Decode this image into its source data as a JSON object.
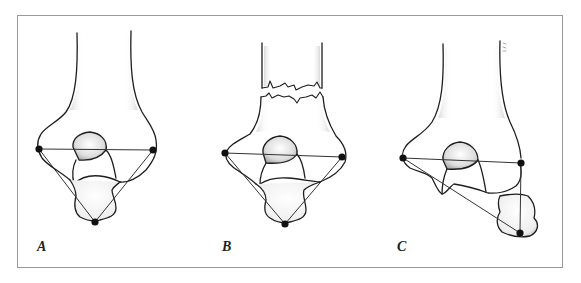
{
  "figure": {
    "panels": [
      {
        "id": "A",
        "label": "A",
        "description": "Normal distal humerus: epicondyles and olecranon tip form an isosceles triangle"
      },
      {
        "id": "B",
        "label": "B",
        "description": "Supracondylar fracture: triangle relationship preserved"
      },
      {
        "id": "C",
        "label": "C",
        "description": "Elbow dislocation: triangle relationship disrupted"
      }
    ],
    "colors": {
      "ink": "#1e1e1e",
      "line": "#333333",
      "frame": "#9a9a9a",
      "background": "#ffffff"
    }
  }
}
